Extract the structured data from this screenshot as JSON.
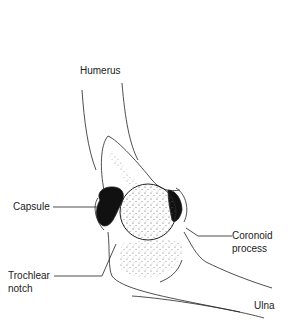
{
  "figure": {
    "labels": {
      "humerus": "Humerus",
      "capsule": "Capsule",
      "coronoid_line1": "Coronoid",
      "coronoid_line2": "process",
      "trochlear_line1": "Trochlear",
      "trochlear_line2": "notch",
      "ulna": "Ulna"
    },
    "colors": {
      "line": "#222222",
      "background": "#ffffff",
      "capsule_fill": "#111111",
      "stipple": "#555555"
    }
  }
}
